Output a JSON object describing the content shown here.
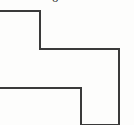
{
  "figure": {
    "kind": "line-drawing",
    "background_color": "#fdfdfc",
    "stroke_color": "#3a3a3a",
    "stroke_width": 2,
    "fill": "none",
    "canvas": {
      "width": 134,
      "height": 125
    },
    "path": "M 0 11 L 40 11 L 40 49 L 119 49 L 119 125 M 2 11 L 2 88 L 0 88 M 2 88 L 81 88 L 81 125",
    "outline_points": [
      {
        "x": 0,
        "y": 11
      },
      {
        "x": 40,
        "y": 11
      },
      {
        "x": 40,
        "y": 49
      },
      {
        "x": 119,
        "y": 49
      },
      {
        "x": 119,
        "y": 125
      },
      {
        "x": 81,
        "y": 125
      },
      {
        "x": 81,
        "y": 88
      },
      {
        "x": 0,
        "y": 88
      }
    ]
  },
  "annotation": {
    "clipped_label": "6",
    "position": {
      "x": 52,
      "y": 0
    }
  }
}
